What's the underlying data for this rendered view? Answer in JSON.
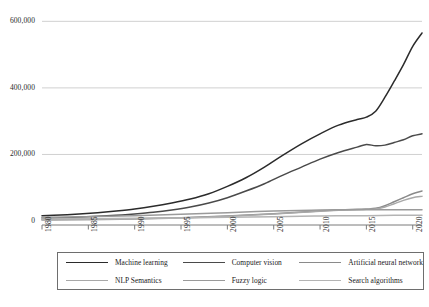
{
  "chart_data": {
    "type": "line",
    "title": "",
    "xlabel": "",
    "ylabel": "",
    "xlim": [
      1980,
      2021
    ],
    "ylim": [
      0,
      640000
    ],
    "grid": true,
    "grid_axis": "y",
    "legend_position": "bottom",
    "x": [
      1980,
      1985,
      1990,
      1995,
      2000,
      2005,
      2010,
      2015,
      2020
    ],
    "xtick_labels": [
      "1980",
      "1985",
      "1990",
      "1995",
      "2000",
      "2005",
      "2010",
      "2015",
      "2020"
    ],
    "ytick_labels": [
      "0",
      "200,000",
      "400,000",
      "600,000"
    ],
    "ytick_values": [
      0,
      200000,
      400000,
      600000
    ],
    "series": [
      {
        "name": "Machine learning",
        "color": "#2b2b2b",
        "x": [
          1980,
          1982,
          1984,
          1986,
          1988,
          1990,
          1992,
          1994,
          1996,
          1998,
          2000,
          2002,
          2004,
          2006,
          2008,
          2010,
          2012,
          2014,
          2015,
          2016,
          2017,
          2018,
          2019,
          2020,
          2021
        ],
        "values": [
          16000,
          18000,
          21000,
          25000,
          30000,
          36000,
          44000,
          54000,
          66000,
          82000,
          104000,
          130000,
          162000,
          198000,
          232000,
          262000,
          288000,
          305000,
          312000,
          330000,
          372000,
          420000,
          470000,
          525000,
          565000
        ]
      },
      {
        "name": "Computer vision",
        "color": "#4a4a4a",
        "x": [
          1980,
          1982,
          1984,
          1986,
          1988,
          1990,
          1992,
          1994,
          1996,
          1998,
          2000,
          2002,
          2004,
          2006,
          2008,
          2010,
          2012,
          2014,
          2015,
          2016,
          2017,
          2018,
          2019,
          2020,
          2021
        ],
        "values": [
          9000,
          10000,
          12000,
          14000,
          17000,
          21000,
          26000,
          33000,
          42000,
          54000,
          70000,
          90000,
          112000,
          138000,
          162000,
          186000,
          206000,
          222000,
          230000,
          226000,
          228000,
          236000,
          244000,
          256000,
          262000
        ]
      },
      {
        "name": "Artificial neural network",
        "color": "#8a8a8a",
        "x": [
          1980,
          1985,
          1990,
          1995,
          2000,
          2005,
          2010,
          2012,
          2014,
          2015,
          2016,
          2017,
          2018,
          2019,
          2020,
          2021
        ],
        "values": [
          4000,
          5000,
          7000,
          10000,
          15000,
          22000,
          30000,
          33000,
          35000,
          36000,
          38000,
          46000,
          58000,
          70000,
          82000,
          90000
        ]
      },
      {
        "name": "NLP Semantics",
        "color": "#a8a8a8",
        "x": [
          1980,
          1985,
          1990,
          1995,
          2000,
          2005,
          2010,
          2012,
          2014,
          2015,
          2016,
          2017,
          2018,
          2019,
          2020,
          2021
        ],
        "values": [
          3000,
          4000,
          6000,
          9000,
          14000,
          21000,
          29000,
          32000,
          34000,
          35000,
          36000,
          42000,
          52000,
          62000,
          70000,
          74000
        ]
      },
      {
        "name": "Fuzzy logic",
        "color": "#9a9a9a",
        "x": [
          1980,
          1985,
          1990,
          1995,
          2000,
          2005,
          2010,
          2015,
          2018,
          2020,
          2021
        ],
        "values": [
          11000,
          13000,
          16000,
          20000,
          25000,
          30000,
          33000,
          34000,
          34000,
          34000,
          34000
        ]
      },
      {
        "name": "Search algorithms",
        "color": "#b4b4b4",
        "x": [
          1980,
          1985,
          1990,
          1995,
          2000,
          2005,
          2010,
          2015,
          2018,
          2020,
          2021
        ],
        "values": [
          6000,
          7000,
          8000,
          9000,
          11000,
          13000,
          15000,
          16000,
          17000,
          17000,
          17000
        ]
      }
    ]
  },
  "legend": {
    "items": [
      {
        "label": "Machine learning"
      },
      {
        "label": "Computer vision"
      },
      {
        "label": "Artificial neural network"
      },
      {
        "label": "NLP Semantics"
      },
      {
        "label": "Fuzzy logic"
      },
      {
        "label": "Search algorithms"
      }
    ]
  },
  "caption": {
    "text": ""
  },
  "colors": {
    "axis": "#7a7a7a",
    "grid": "#d0d0d0",
    "text": "#1a1a1a",
    "legend_border": "#6e6e6e"
  }
}
